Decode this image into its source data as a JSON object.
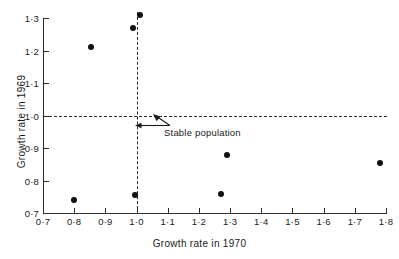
{
  "chart_data": {
    "type": "scatter",
    "title": "",
    "xlabel": "Growth rate in 1970",
    "ylabel": "Growth rate in 1969",
    "xlim": [
      0.7,
      1.8
    ],
    "ylim": [
      0.7,
      1.3
    ],
    "xticks": [
      "0·7",
      "0·8",
      "0·9",
      "1·0",
      "1·1",
      "1·2",
      "1·3",
      "1·4",
      "1·5",
      "1·6",
      "1·7",
      "1·8"
    ],
    "xtick_values": [
      0.7,
      0.8,
      0.9,
      1.0,
      1.1,
      1.2,
      1.3,
      1.4,
      1.5,
      1.6,
      1.7,
      1.8
    ],
    "yticks": [
      "0·7",
      "0·8",
      "0·9",
      "1·0",
      "1·1",
      "1·2",
      "1·3"
    ],
    "ytick_values": [
      0.7,
      0.8,
      0.9,
      1.0,
      1.1,
      1.2,
      1.3
    ],
    "grid": false,
    "legend": null,
    "points": [
      {
        "x": 0.8,
        "y": 0.74
      },
      {
        "x": 0.855,
        "y": 1.21
      },
      {
        "x": 0.99,
        "y": 1.27
      },
      {
        "x": 1.01,
        "y": 1.31
      },
      {
        "x": 0.995,
        "y": 0.755
      },
      {
        "x": 1.27,
        "y": 0.76
      },
      {
        "x": 1.29,
        "y": 0.88
      },
      {
        "x": 1.78,
        "y": 0.855
      }
    ],
    "reference_lines": [
      {
        "orientation": "horizontal",
        "value": 1.0,
        "style": "dashed"
      },
      {
        "orientation": "vertical",
        "value": 1.0,
        "style": "dashed"
      }
    ],
    "annotations": [
      {
        "text": "Stable population",
        "points_to_x": 1.0,
        "points_to_y": 1.0
      }
    ]
  }
}
